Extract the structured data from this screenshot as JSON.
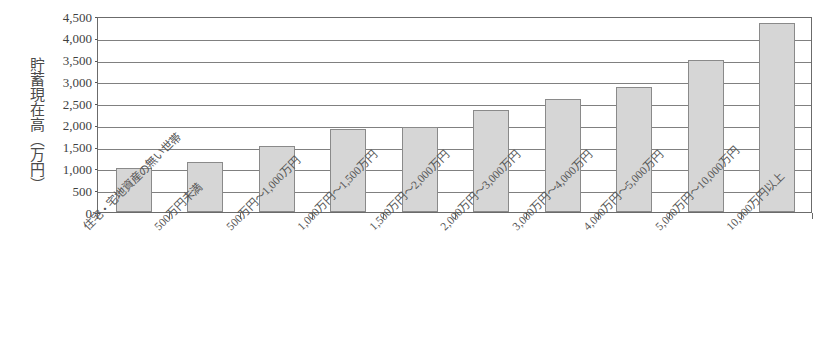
{
  "chart_data": {
    "type": "bar",
    "title": "",
    "subtitle": "",
    "xlabel": "",
    "ylabel": "貯蓄現在高(万円)",
    "ylabel_chars": "貯蓄現在高（万円）",
    "ylim": [
      0,
      4500
    ],
    "ytick_step": 500,
    "grid": true,
    "legend": "none",
    "bar_fill_color": "#d6d6d6",
    "bar_border_color": "#8a8a8a",
    "frame_color": "#6b6b6b",
    "gridline_color": "#808080",
    "background_color": "#ffffff",
    "ytick_labels": [
      "4,500",
      "4,000",
      "3,500",
      "3,000",
      "2,500",
      "2,000",
      "1,500",
      "1,000",
      "500",
      "0"
    ],
    "ytick_values": [
      4500,
      4000,
      3500,
      3000,
      2500,
      2000,
      1500,
      1000,
      500,
      0
    ],
    "categories": [
      "住宅・宅地資産の無い世帯",
      "500万円未満",
      "500万円～1,000万円",
      "1,000万円～1,500万円",
      "1,500万円～2,000万円",
      "2,000万円～3,000万円",
      "3,000万円～4,000万円",
      "4,000万円～5,000万円",
      "5,000万円～10,000万円",
      "10,000万円以上"
    ],
    "values": [
      1000,
      1150,
      1520,
      1900,
      1960,
      2350,
      2600,
      2880,
      3480,
      4330
    ]
  }
}
